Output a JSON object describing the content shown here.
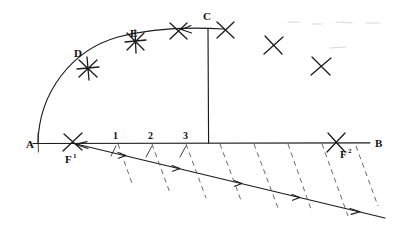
{
  "figure": {
    "kind": "geometric-construction-diagram",
    "medium": "hand-drawn line drawing",
    "background_color": "#ffffff",
    "ink_color": "#1b1b1b",
    "dash_color": "#585858",
    "width": 414,
    "height": 240
  },
  "labels": {
    "a": "A",
    "b": "B",
    "c": "C",
    "d": "D",
    "e": "E",
    "f1_base": "F",
    "f1_sup": "1",
    "f2_base": "F",
    "f2_sup": "2"
  },
  "baseline_numbers": [
    {
      "text": "1"
    },
    {
      "text": "2"
    },
    {
      "text": "3"
    }
  ],
  "points": {
    "A": {
      "x": 38,
      "y": 143,
      "label": "A"
    },
    "B": {
      "x": 370,
      "y": 143,
      "label": "B"
    },
    "C": {
      "x": 208,
      "y": 28,
      "label": "C"
    },
    "D": {
      "x": 88,
      "y": 68,
      "label": "D"
    },
    "E": {
      "x": 135,
      "y": 40,
      "label": "E"
    },
    "F1": {
      "x": 72,
      "y": 143,
      "label": "F1"
    },
    "F2": {
      "x": 336,
      "y": 143,
      "label": "F2"
    }
  },
  "geometry": {
    "baseline": {
      "x1": 33,
      "y1": 143,
      "x2": 370,
      "y2": 143
    },
    "vertical": {
      "x": 208,
      "y_top": 28,
      "y_bottom": 143
    },
    "arc": {
      "from_x": 38,
      "from_y": 143,
      "to_x": 224,
      "to_y": 29
    },
    "diagonal": {
      "x1": 72,
      "y1": 143,
      "x2": 385,
      "y2": 218
    }
  },
  "x_marks": [
    {
      "x": 88,
      "y": 68,
      "size": 9,
      "near": "D"
    },
    {
      "x": 135,
      "y": 41,
      "size": 9,
      "near": "E"
    },
    {
      "x": 178,
      "y": 31,
      "size": 9,
      "near": "arc"
    },
    {
      "x": 225,
      "y": 30,
      "size": 9,
      "near": "C-right"
    },
    {
      "x": 273,
      "y": 45,
      "size": 9,
      "near": "free-1"
    },
    {
      "x": 320,
      "y": 66,
      "size": 9,
      "near": "free-2"
    },
    {
      "x": 72,
      "y": 143,
      "size": 8,
      "near": "F1"
    },
    {
      "x": 336,
      "y": 143,
      "size": 8,
      "near": "F2"
    }
  ],
  "hatch_lines": {
    "count": 8,
    "note": "short dashed strokes falling from baseline toward the diagonal"
  },
  "diagonal_arrow_ticks": {
    "count": 5,
    "note": "small chevron arrowheads placed along the diagonal"
  }
}
